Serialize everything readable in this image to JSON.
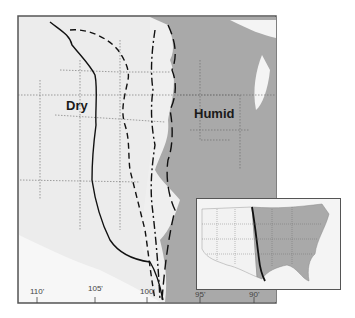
{
  "map": {
    "region_labels": {
      "dry": "Dry",
      "humid": "Humid"
    },
    "longitude_ticks": [
      "110'",
      "105'",
      "100'",
      "95'",
      "90'"
    ],
    "colors": {
      "dry": "#ececec",
      "humid": "#a9a9a9",
      "boundary": "#111111",
      "frame": "#555555",
      "water": "#f2f2f2"
    },
    "boundary_lines": [
      {
        "style": "solid"
      },
      {
        "style": "dashed"
      },
      {
        "style": "dash-dot"
      },
      {
        "style": "long-dash"
      }
    ],
    "inset": {
      "description": "Contiguous United States with dry/humid boundary line"
    }
  }
}
